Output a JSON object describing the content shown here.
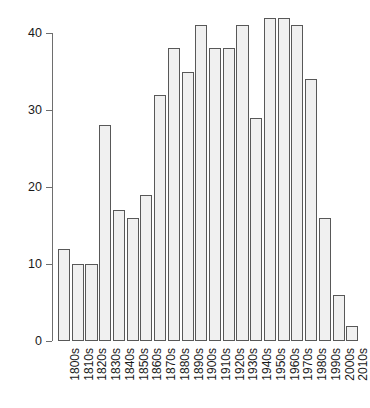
{
  "chart_data": {
    "type": "bar",
    "title": "",
    "subtitle": "",
    "xlabel": "",
    "ylabel": "",
    "categories": [
      "1800s",
      "1810s",
      "1820s",
      "1830s",
      "1840s",
      "1850s",
      "1860s",
      "1870s",
      "1880s",
      "1890s",
      "1900s",
      "1910s",
      "1920s",
      "1930s",
      "1940s",
      "1950s",
      "1960s",
      "1970s",
      "1980s",
      "1990s",
      "2000s",
      "2010s"
    ],
    "values": [
      12,
      10,
      10,
      28,
      17,
      16,
      19,
      32,
      38,
      35,
      41,
      38,
      38,
      41,
      29,
      42,
      42,
      41,
      34,
      16,
      6,
      2
    ],
    "ylim": [
      0,
      42
    ],
    "yticks": [
      0,
      10,
      20,
      30,
      40
    ],
    "ytick_labels": [
      "0",
      "10",
      "20",
      "30",
      "40"
    ],
    "grid": false,
    "legend": false,
    "legend_position": "none",
    "bar_fill_color": "#f0f0f0",
    "bar_border_color": "#585858",
    "axis_color": "#6e6e6e",
    "text_color": "#1a1a1a",
    "background_color": "#ffffff",
    "xtick_label_rotation": -90
  }
}
